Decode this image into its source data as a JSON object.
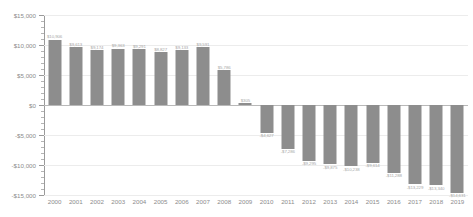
{
  "chart_data": {
    "type": "bar",
    "title": "",
    "subtitle": "",
    "xlabel": "",
    "ylabel": "",
    "ylim": [
      -15000,
      15000
    ],
    "ytick_step": 5000,
    "grid": true,
    "legend": false,
    "orientation": "vertical",
    "bar_color": "#8d8d8d",
    "categories": [
      "2000",
      "2001",
      "2002",
      "2003",
      "2004",
      "2005",
      "2006",
      "2007",
      "2008",
      "2009",
      "2010",
      "2011",
      "2012",
      "2013",
      "2014",
      "2015",
      "2016",
      "2017",
      "2018",
      "2019"
    ],
    "values": [
      10906,
      9613,
      9174,
      9363,
      9291,
      8827,
      9133,
      9591,
      5786,
      305,
      -4627,
      -7286,
      -9295,
      -9875,
      -10238,
      -9614,
      -11288,
      -13229,
      -13340,
      -14631
    ],
    "value_labels": [
      "$10,906",
      "$9,613",
      "$9,174",
      "$9,363",
      "$9,291",
      "$8,827",
      "$9,133",
      "$9,591",
      "$5,786",
      "$305",
      "-$4,627",
      "-$7,286",
      "-$9,295",
      "-$9,875",
      "-$10,238",
      "-$9,614",
      "-$11,288",
      "-$13,229",
      "-$13,340",
      "-$14,631"
    ],
    "ytick_labels": [
      "$15,000",
      "$10,000",
      "$5,000",
      "$0",
      "-$5,000",
      "-$10,000",
      "-$15,000"
    ],
    "ytick_values": [
      15000,
      10000,
      5000,
      0,
      -5000,
      -10000,
      -15000
    ]
  }
}
